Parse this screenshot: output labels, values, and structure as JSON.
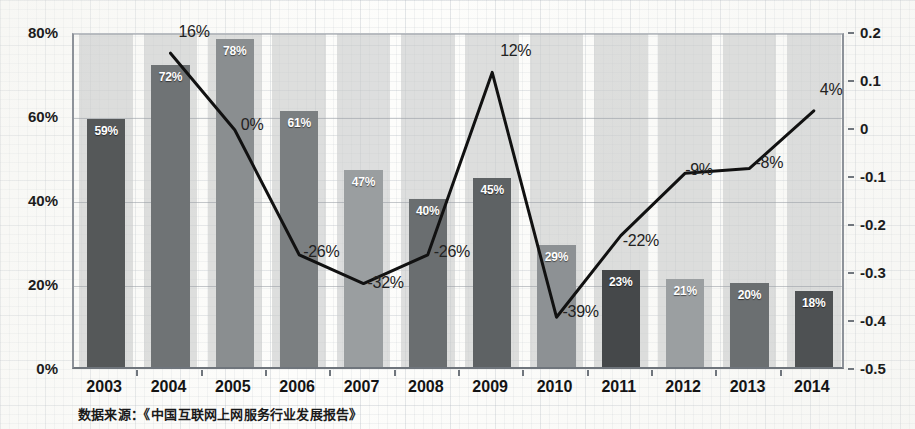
{
  "chart_data": {
    "type": "bar",
    "title": "",
    "subtitle": "",
    "xlabel": "",
    "ylabel": "",
    "grid": true,
    "legend_position": "none",
    "categories": [
      "2003",
      "2004",
      "2005",
      "2006",
      "2007",
      "2008",
      "2009",
      "2010",
      "2011",
      "2012",
      "2013",
      "2014"
    ],
    "series": [
      {
        "name": "bars",
        "type": "bar",
        "axis": "left",
        "value_labels": [
          "59%",
          "72%",
          "78%",
          "61%",
          "47%",
          "40%",
          "45%",
          "29%",
          "23%",
          "21%",
          "20%",
          "18%"
        ],
        "values": [
          0.59,
          0.72,
          0.78,
          0.61,
          0.47,
          0.4,
          0.45,
          0.29,
          0.23,
          0.21,
          0.2,
          0.18
        ],
        "colors": [
          "#555859",
          "#6f7375",
          "#8a8e90",
          "#7b7f81",
          "#9a9ea0",
          "#6a6e70",
          "#5e6264",
          "#8d9194",
          "#45484a",
          "#9b9fa1",
          "#6b6f71",
          "#4e5153"
        ]
      },
      {
        "name": "line",
        "type": "line",
        "axis": "right",
        "color": "#111111",
        "x": [
          "2004",
          "2005",
          "2006",
          "2007",
          "2008",
          "2009",
          "2010",
          "2011",
          "2012",
          "2013",
          "2014"
        ],
        "value_labels": [
          "16%",
          "0%",
          "-26%",
          "-32%",
          "-26%",
          "12%",
          "-39%",
          "-22%",
          "-9%",
          "-8%",
          "4%"
        ],
        "values": [
          0.16,
          0.0,
          -0.26,
          -0.32,
          -0.26,
          0.12,
          -0.39,
          -0.22,
          -0.09,
          -0.08,
          0.04
        ]
      }
    ],
    "left_axis": {
      "ticks": [
        "80%",
        "60%",
        "40%",
        "20%",
        "0%"
      ],
      "values": [
        0.8,
        0.6,
        0.4,
        0.2,
        0.0
      ],
      "ylim": [
        0,
        0.8
      ]
    },
    "right_axis": {
      "ticks": [
        "0.2",
        "0.1",
        "0",
        "-0.1",
        "-0.2",
        "-0.3",
        "-0.4",
        "-0.5"
      ],
      "values": [
        0.2,
        0.1,
        0,
        -0.1,
        -0.2,
        -0.3,
        -0.4,
        -0.5
      ],
      "ylim": [
        -0.5,
        0.2
      ]
    },
    "source_note": "数据来源：《中国互联网上网服务行业发展报告》"
  }
}
